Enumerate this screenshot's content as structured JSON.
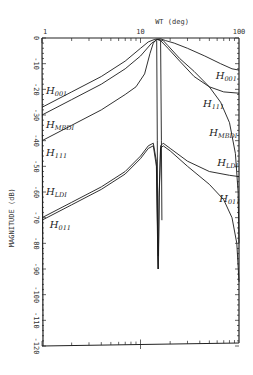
{
  "chart_data": {
    "type": "line",
    "title": "",
    "xlabel": "WT (deg)",
    "ylabel": "MAGNITUDE (dB)",
    "xscale": "log",
    "xlim": [
      1,
      100
    ],
    "ylim": [
      -120,
      0
    ],
    "x_tick_labels": [
      {
        "value": 1,
        "label": "1"
      },
      {
        "value": 10,
        "label": "10"
      },
      {
        "value": 100,
        "label": "100"
      }
    ],
    "y_tick_labels": [
      {
        "value": 0,
        "label": "0"
      },
      {
        "value": -10,
        "label": "-10"
      },
      {
        "value": -20,
        "label": "-20"
      },
      {
        "value": -30,
        "label": "-30"
      },
      {
        "value": -40,
        "label": "-40"
      },
      {
        "value": -50,
        "label": "-50"
      },
      {
        "value": -60,
        "label": "-60"
      },
      {
        "value": -70,
        "label": "-70"
      },
      {
        "value": -80,
        "label": "-80"
      },
      {
        "value": -90,
        "label": "-90"
      },
      {
        "value": -100,
        "label": "-100"
      },
      {
        "value": -110,
        "label": "-110"
      },
      {
        "value": -120,
        "label": "-120"
      }
    ],
    "grid": false,
    "legend": "none (inline curve labels)",
    "series": [
      {
        "name": "H_001",
        "label_main": "H",
        "label_sub": "001",
        "points": [
          [
            1,
            -27
          ],
          [
            2,
            -21
          ],
          [
            4,
            -15
          ],
          [
            7,
            -9
          ],
          [
            10,
            -4
          ],
          [
            12,
            -1.5
          ],
          [
            14,
            -0.5
          ],
          [
            16,
            -0.3
          ],
          [
            18,
            -1
          ],
          [
            22,
            -2
          ],
          [
            30,
            -4
          ],
          [
            45,
            -7
          ],
          [
            65,
            -10
          ],
          [
            85,
            -12
          ],
          [
            100,
            -12.5
          ]
        ]
      },
      {
        "name": "H_MBDI",
        "label_main": "H",
        "label_sub": "MBDI",
        "points": [
          [
            1,
            -30
          ],
          [
            2,
            -24
          ],
          [
            4,
            -18
          ],
          [
            7,
            -12
          ],
          [
            10,
            -7
          ],
          [
            13,
            -2
          ],
          [
            15,
            -0.5
          ],
          [
            17,
            -1
          ],
          [
            19,
            -3
          ],
          [
            25,
            -8
          ],
          [
            35,
            -13
          ],
          [
            50,
            -19
          ],
          [
            65,
            -25
          ],
          [
            80,
            -33
          ],
          [
            92,
            -45
          ],
          [
            98,
            -60
          ],
          [
            100,
            -80
          ]
        ]
      },
      {
        "name": "H_111",
        "label_main": "H",
        "label_sub": "111",
        "points": [
          [
            1,
            -40
          ],
          [
            2,
            -34
          ],
          [
            4,
            -28
          ],
          [
            7,
            -22
          ],
          [
            9,
            -19
          ],
          [
            11,
            -14
          ],
          [
            12.5,
            -6
          ],
          [
            13.5,
            -2
          ],
          [
            14.5,
            -0.5
          ],
          [
            16,
            -1
          ],
          [
            19,
            -4
          ],
          [
            25,
            -9
          ],
          [
            35,
            -15
          ],
          [
            50,
            -19
          ],
          [
            70,
            -21
          ],
          [
            100,
            -21.5
          ]
        ]
      },
      {
        "name": "H_LDI",
        "label_main": "H",
        "label_sub": "LDI",
        "points": [
          [
            1,
            -70
          ],
          [
            2,
            -64
          ],
          [
            4,
            -58
          ],
          [
            7,
            -52
          ],
          [
            10,
            -46
          ],
          [
            12,
            -42
          ],
          [
            13.5,
            -41
          ],
          [
            14.5,
            -48
          ],
          [
            15,
            -80
          ],
          [
            15.2,
            -85
          ],
          [
            15.5,
            -60
          ],
          [
            16,
            -42
          ],
          [
            17,
            -41
          ],
          [
            20,
            -43
          ],
          [
            30,
            -48
          ],
          [
            50,
            -52
          ],
          [
            80,
            -53.5
          ],
          [
            100,
            -54
          ]
        ]
      },
      {
        "name": "H_011",
        "label_main": "H",
        "label_sub": "011",
        "points": [
          [
            1,
            -71
          ],
          [
            2,
            -65
          ],
          [
            4,
            -59
          ],
          [
            7,
            -53
          ],
          [
            10,
            -47
          ],
          [
            12,
            -43
          ],
          [
            13.5,
            -42
          ],
          [
            14.5,
            -50
          ],
          [
            15,
            -85
          ],
          [
            15.2,
            -90
          ],
          [
            15.5,
            -62
          ],
          [
            16,
            -43
          ],
          [
            17,
            -42
          ],
          [
            20,
            -44
          ],
          [
            30,
            -50
          ],
          [
            50,
            -57
          ],
          [
            70,
            -63
          ],
          [
            85,
            -70
          ],
          [
            95,
            -80
          ],
          [
            100,
            -95
          ]
        ]
      },
      {
        "name": "notch-low",
        "label_main": "",
        "label_sub": "",
        "points": [
          [
            14.6,
            -1
          ],
          [
            14.8,
            -40
          ],
          [
            15.0,
            -90
          ]
        ]
      },
      {
        "name": "notch-high",
        "label_main": "",
        "label_sub": "",
        "points": [
          [
            16.0,
            -1
          ],
          [
            16.3,
            -40
          ],
          [
            16.5,
            -71
          ]
        ]
      }
    ],
    "annotations": [
      {
        "text_main": "H",
        "text_sub": "001",
        "x": 1.1,
        "y": -22
      },
      {
        "text_main": "H",
        "text_sub": "MBDI",
        "x": 1.1,
        "y": -35
      },
      {
        "text_main": "H",
        "text_sub": "111",
        "x": 1.1,
        "y": -46
      },
      {
        "text_main": "H",
        "text_sub": "001",
        "x": 58,
        "y": -16
      },
      {
        "text_main": "H",
        "text_sub": "111",
        "x": 43,
        "y": -27
      },
      {
        "text_main": "H",
        "text_sub": "MBDI",
        "x": 50,
        "y": -38
      },
      {
        "text_main": "H",
        "text_sub": "LDI",
        "x": 60,
        "y": -50
      },
      {
        "text_main": "H",
        "text_sub": "011",
        "x": 63,
        "y": -64
      },
      {
        "text_main": "H",
        "text_sub": "LDI",
        "x": 1.1,
        "y": -61
      },
      {
        "text_main": "H",
        "text_sub": "011",
        "x": 1.2,
        "y": -74
      }
    ]
  }
}
